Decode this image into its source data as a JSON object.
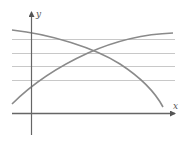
{
  "figure": {
    "x_axis_label": "x",
    "y_axis_label": "y",
    "colors": {
      "axis": "#666666",
      "gridline": "#c8c8c8",
      "curve": "#8a8a8a"
    },
    "gridlines_y": [
      39,
      53,
      66,
      80
    ],
    "curves": [
      {
        "name": "decreasing-curve",
        "description": "concave-down curve decreasing from upper left to lower right"
      },
      {
        "name": "increasing-curve",
        "description": "concave-down curve increasing from lower left to upper right"
      }
    ]
  }
}
